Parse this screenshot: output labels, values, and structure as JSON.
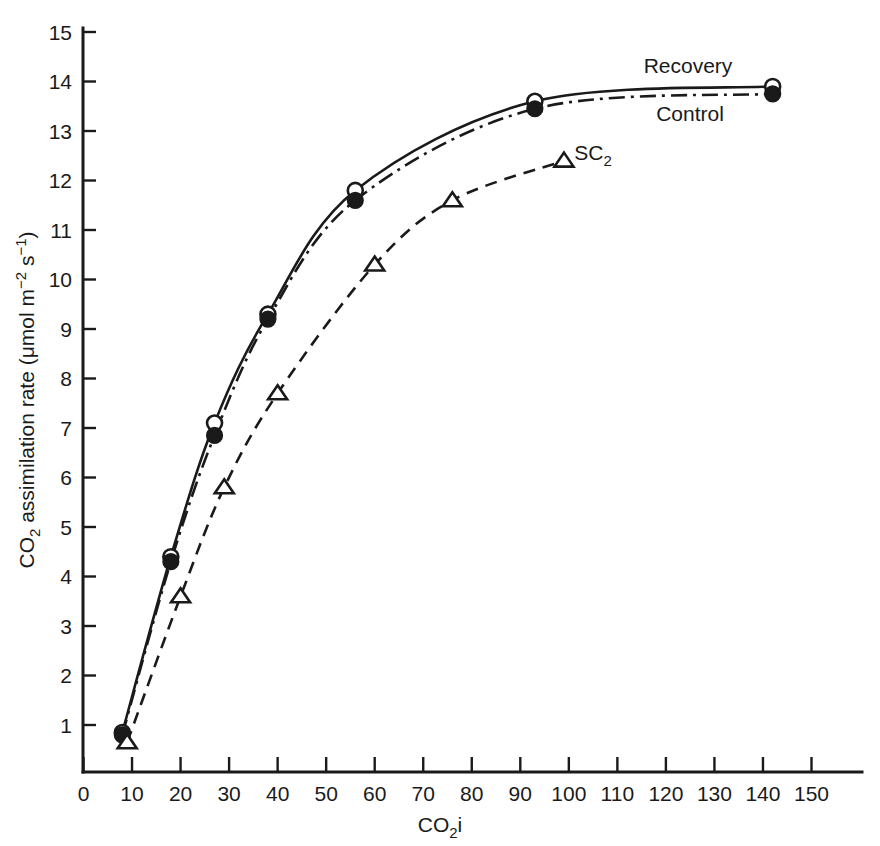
{
  "chart_data": {
    "type": "line",
    "title": "",
    "xlabel": "CO2i",
    "ylabel": "CO2 assimilation rate (umol m-2 s-1)",
    "xlabel_parts": {
      "base": "CO",
      "sub": "2",
      "tail": "i"
    },
    "ylabel_parts": {
      "base": "CO",
      "sub": "2",
      "middle": " assimilation rate (μmol m",
      "sup1": "−2",
      "mid2": " s",
      "sup2": "−1",
      "tail": ")"
    },
    "xlim": [
      0,
      158
    ],
    "ylim": [
      0,
      15.4
    ],
    "xticks": [
      0,
      10,
      20,
      30,
      40,
      50,
      60,
      70,
      80,
      90,
      100,
      110,
      120,
      130,
      140,
      150
    ],
    "yticks": [
      1,
      2,
      3,
      4,
      5,
      6,
      7,
      8,
      9,
      10,
      11,
      12,
      13,
      14,
      15
    ],
    "grid": false,
    "legend_position": "inline-annotations",
    "series": [
      {
        "name": "Recovery",
        "marker": "open-circle",
        "line_style": "solid",
        "x": [
          8,
          18,
          27,
          38,
          56,
          93,
          142
        ],
        "y": [
          0.85,
          4.4,
          7.1,
          9.3,
          11.8,
          13.6,
          13.9
        ]
      },
      {
        "name": "Control",
        "marker": "filled-circle",
        "line_style": "dash-dot",
        "x": [
          8,
          18,
          27,
          38,
          56,
          93,
          142
        ],
        "y": [
          0.8,
          4.3,
          6.85,
          9.2,
          11.6,
          13.45,
          13.75
        ]
      },
      {
        "name": "SC2",
        "marker": "open-triangle",
        "line_style": "dashed",
        "x": [
          9,
          20,
          29,
          40,
          60,
          76,
          99
        ],
        "y": [
          0.65,
          3.6,
          5.8,
          7.7,
          10.3,
          11.6,
          12.4
        ]
      }
    ],
    "annotations": [
      {
        "text": "Recovery",
        "x_px": 688,
        "y_px": 73
      },
      {
        "text": "Control",
        "x_px": 690,
        "y_px": 121
      },
      {
        "text": "SC",
        "sub": "2",
        "x_px": 593,
        "y_px": 160
      }
    ]
  }
}
